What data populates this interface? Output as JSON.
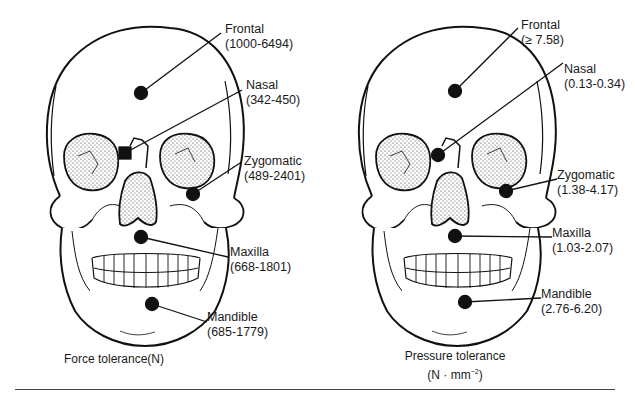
{
  "figure": {
    "panels": [
      {
        "caption": "Force tolerance(N)",
        "labels": [
          {
            "name": "Frontal",
            "range": "(1000-6494)"
          },
          {
            "name": "Nasal",
            "range": "(342-450)"
          },
          {
            "name": "Zygomatic",
            "range": "(489-2401)"
          },
          {
            "name": "Maxilla",
            "range": "(668-1801)"
          },
          {
            "name": "Mandible",
            "range": "(685-1779)"
          }
        ]
      },
      {
        "caption_line1": "Pressure tolerance",
        "caption_line2": "(N · mm",
        "caption_sup": "−2",
        "caption_end": ")",
        "labels": [
          {
            "name": "Frontal",
            "range": "(≥ 7.58)"
          },
          {
            "name": "Nasal",
            "range": "(0.13-0.34)"
          },
          {
            "name": "Zygomatic",
            "range": "(1.38-4.17)"
          },
          {
            "name": "Maxilla",
            "range": "(1.03-2.07)"
          },
          {
            "name": "Mandible",
            "range": "(2.76-6.20)"
          }
        ]
      }
    ]
  }
}
